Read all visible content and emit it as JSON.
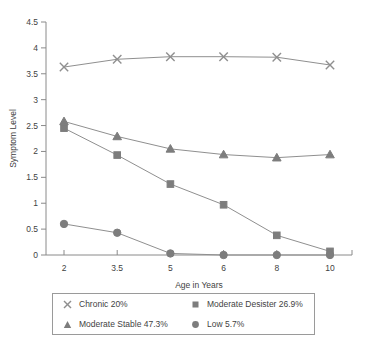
{
  "chart_data": {
    "type": "line",
    "title": "",
    "xlabel": "Age in Years",
    "ylabel": "Symptom Level",
    "categories": [
      "2",
      "3.5",
      "5",
      "6",
      "8",
      "10"
    ],
    "x_tick_labels": [
      "2",
      "3.5",
      "5",
      "6",
      "8",
      "10"
    ],
    "y_tick_labels": [
      "0",
      "0.5",
      "1",
      "1.5",
      "2",
      "2.5",
      "3",
      "3.5",
      "4",
      "4.5"
    ],
    "ylim": [
      0,
      4.5
    ],
    "y_tick_step": 0.5,
    "grid": false,
    "legend_position": "bottom",
    "series": [
      {
        "name": "Chronic 20%",
        "marker": "x",
        "values": [
          3.63,
          3.78,
          3.83,
          3.83,
          3.82,
          3.67
        ]
      },
      {
        "name": "Moderate Desister 26.9%",
        "marker": "square",
        "values": [
          2.45,
          1.93,
          1.37,
          0.97,
          0.38,
          0.07
        ]
      },
      {
        "name": "Moderate Stable 47.3%",
        "marker": "triangle",
        "values": [
          2.58,
          2.29,
          2.05,
          1.94,
          1.88,
          1.94
        ]
      },
      {
        "name": "Low 5.7%",
        "marker": "circle",
        "values": [
          0.6,
          0.43,
          0.03,
          0.0,
          0.0,
          0.0
        ]
      }
    ]
  },
  "legend": {
    "entries": [
      {
        "label": "Chronic 20%",
        "marker": "x"
      },
      {
        "label": "Moderate Desister 26.9%",
        "marker": "square"
      },
      {
        "label": "Moderate Stable 47.3%",
        "marker": "triangle"
      },
      {
        "label": "Low 5.7%",
        "marker": "circle"
      }
    ]
  },
  "colors": {
    "marker": "#7d7d7d",
    "line": "#8f8f8f",
    "axis": "#8a8a8a",
    "text": "#3f3f3f",
    "background": "#ffffff"
  }
}
